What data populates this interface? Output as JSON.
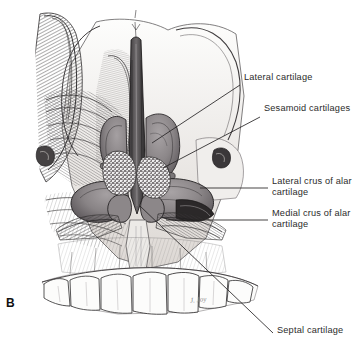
{
  "figure": {
    "panel_letter": "B",
    "signature": "J. Joy",
    "background_color": "#ffffff",
    "ink_color": "#2b2b2b"
  },
  "labels": [
    {
      "id": "lateral-cartilage",
      "text": "Lateral cartilage",
      "lines": [
        "Lateral cartilage"
      ],
      "x": 244,
      "y": 77,
      "leader": {
        "x1": 240,
        "y1": 85,
        "x2": 152,
        "y2": 143
      }
    },
    {
      "id": "sesamoid-cartilages",
      "text": "Sesamoid cartilages",
      "lines": [
        "Sesamoid cartilages"
      ],
      "x": 264,
      "y": 108,
      "leader": {
        "x1": 260,
        "y1": 117,
        "x2": 163,
        "y2": 168
      }
    },
    {
      "id": "lateral-crus-of-alar-cartilage",
      "text": "Lateral crus of alar cartilage",
      "lines": [
        "Lateral crus of alar",
        "cartilage"
      ],
      "x": 272,
      "y": 180,
      "leader": {
        "x1": 268,
        "y1": 188,
        "x2": 200,
        "y2": 188
      }
    },
    {
      "id": "medial-crus-of-alar-cartilage",
      "text": "Medial crus of alar cartilage",
      "lines": [
        "Medial crus of alar",
        "cartilage"
      ],
      "x": 272,
      "y": 212,
      "leader": {
        "x1": 268,
        "y1": 220,
        "x2": 166,
        "y2": 220
      }
    },
    {
      "id": "septal-cartilage",
      "text": "Septal cartilage",
      "lines": [
        "Septal cartilage"
      ],
      "x": 277,
      "y": 330,
      "leader": {
        "x1": 273,
        "y1": 333,
        "x2": 140,
        "y2": 206
      }
    }
  ],
  "palette": {
    "cartilage_gray": "#8f8a8c",
    "cartilage_gray_dark": "#6f6a6d",
    "cartilage_gray_light": "#a9a4a6",
    "bone_light": "#f2f0ee",
    "bone_shadow": "#cfcac6",
    "tooth_white": "#fbfbfa",
    "hatch_ink": "#3c3a3b",
    "stipple": "#ffffff",
    "outline": "#1c1a1b"
  }
}
